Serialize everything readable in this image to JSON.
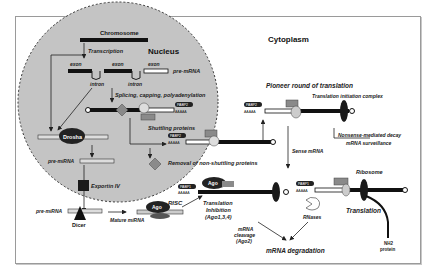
{
  "diagram": {
    "regions": {
      "nucleus": "Nucleus",
      "cytoplasm": "Cytoplasm"
    },
    "nucleus_labels": {
      "chromosome": "Chromosome",
      "transcription": "Transcription",
      "exon1": "exon",
      "exon2": "exon",
      "exon3": "exon",
      "pre_mrna": "pre-mRNA",
      "intron1": "intron",
      "intron2": "intron",
      "splicing": "Splicing, capping, polyadenylation",
      "shuttling": "Shuttling proteins",
      "removal": "Removal of non-shuttling proteins",
      "drosha": "Drosha",
      "pri_mirna_label": "pre-miRNA"
    },
    "export_labels": {
      "exportin": "Exportin IV",
      "pre_mirna": "pre-miRNA",
      "dicer": "Dicer",
      "mature_mirna": "Mature miRNA",
      "risc": "RISC",
      "ago": "Ago",
      "ago2": "Ago"
    },
    "cytoplasm_labels": {
      "pioneer": "Pioneer round of translation",
      "tic": "Translation initiation complex",
      "nmd1": "Nonsense-mediated decay",
      "nmd2": "mRNA surveillance",
      "sense": "Sense mRNA",
      "ribosome": "Ribosome",
      "translation": "Translation",
      "nh2": "NH2",
      "protein": "protein",
      "rnases": "RNases",
      "trans_inhib1": "Translation",
      "trans_inhib2": "Inhibition",
      "trans_inhib3": "(Ago1,3,4)",
      "cleave1": "mRNA",
      "cleave2": "cleavage",
      "cleave3": "(Ago2)",
      "degradation": "mRNA degradation"
    },
    "tags": {
      "pabp": "PABP2",
      "pabp1": "PABP1",
      "polya": "AAAAA"
    },
    "colors": {
      "nucleus_fill": "#c4c4c4",
      "dark": "#1a1a1a",
      "gray_block": "#8a8a8a",
      "light_block": "#d8d8d8",
      "frame": "#9a9a9a"
    }
  }
}
